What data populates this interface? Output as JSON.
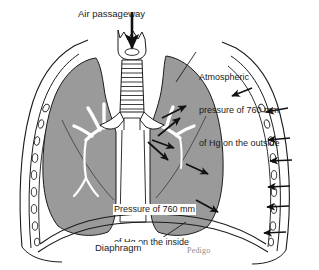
{
  "figure": {
    "width": 319,
    "height": 270,
    "background_color": "#ffffff"
  },
  "colors": {
    "lung_fill": "#9a9a9a",
    "lung_fill_dark": "#8e8e8e",
    "outline": "#1b1b1b",
    "arrow": "#111111",
    "text": "#1b1b1b",
    "watermark": "#8d8d8d",
    "airway_fill": "#ffffff",
    "body_cavity_fill": "#ffffff"
  },
  "labels": {
    "air_passageway": "Air passageway",
    "atmospheric_line1": "Atmospheric",
    "atmospheric_line2": "pressure of 760 mm",
    "atmospheric_line3": "of Hg on the outside",
    "inside_line1": "Pressure of 760 mm",
    "inside_line2": "of Hg on the inside",
    "diaphragm": "Diaphragm",
    "watermark": "Pedigo"
  },
  "anatomy": {
    "parts": [
      "trachea",
      "larynx",
      "bronchi",
      "bronchial-tree-left",
      "bronchial-tree-right",
      "lung-left",
      "lung-right",
      "rib-cage",
      "diaphragm",
      "body-wall"
    ],
    "trachea_ring_count": 12,
    "rib_count_left": 9,
    "rib_count_right": 9
  },
  "annotations": {
    "inhalation_arrow": "downward arrow into larynx",
    "outside_arrow_count": 7,
    "inside_arrow_count": 6,
    "pressure_value": "760 mm of Hg"
  }
}
